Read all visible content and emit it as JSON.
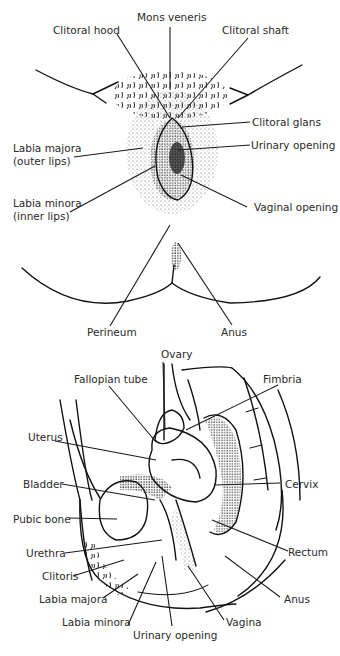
{
  "external_view": {
    "labels": [
      {
        "id": "mons-veneris",
        "text": "Mons veneris"
      },
      {
        "id": "clitoral-hood",
        "text": "Clitoral hood"
      },
      {
        "id": "clitoral-shaft",
        "text": "Clitoral shaft"
      },
      {
        "id": "clitoral-glans",
        "text": "Clitoral glans"
      },
      {
        "id": "urinary-opening",
        "text": "Urinary opening"
      },
      {
        "id": "labia-majora",
        "text": "Labia majora"
      },
      {
        "id": "labia-majora-sub",
        "text": "(outer lips)"
      },
      {
        "id": "labia-minora",
        "text": "Labia minora"
      },
      {
        "id": "labia-minora-sub",
        "text": "(inner lips)"
      },
      {
        "id": "vaginal-opening",
        "text": "Vaginal opening"
      },
      {
        "id": "perineum",
        "text": "Perineum"
      },
      {
        "id": "anus",
        "text": "Anus"
      }
    ]
  },
  "sagittal_view": {
    "labels": [
      {
        "id": "ovary",
        "text": "Ovary"
      },
      {
        "id": "fallopian-tube",
        "text": "Fallopian tube"
      },
      {
        "id": "fimbria",
        "text": "Fimbria"
      },
      {
        "id": "uterus",
        "text": "Uterus"
      },
      {
        "id": "bladder",
        "text": "Bladder"
      },
      {
        "id": "cervix",
        "text": "Cervix"
      },
      {
        "id": "pubic-bone",
        "text": "Pubic bone"
      },
      {
        "id": "rectum",
        "text": "Rectum"
      },
      {
        "id": "urethra",
        "text": "Urethra"
      },
      {
        "id": "clitoris",
        "text": "Clitoris"
      },
      {
        "id": "anus",
        "text": "Anus"
      },
      {
        "id": "labia-majora",
        "text": "Labia majora"
      },
      {
        "id": "labia-minora",
        "text": "Labia minora"
      },
      {
        "id": "vagina",
        "text": "Vagina"
      },
      {
        "id": "urinary-opening",
        "text": "Urinary opening"
      }
    ]
  }
}
